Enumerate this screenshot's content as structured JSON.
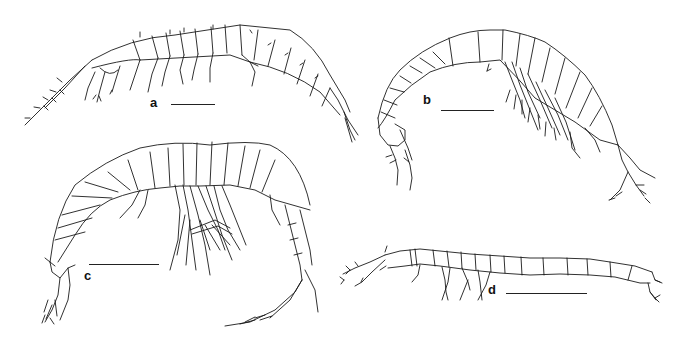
{
  "figure": {
    "panels": [
      {
        "label": "a",
        "label_pos": [
          153,
          102
        ],
        "scale_bar": {
          "x1": 171,
          "x2": 215,
          "y": 104
        }
      },
      {
        "label": "b",
        "label_pos": [
          426,
          99
        ],
        "scale_bar": {
          "x1": 441,
          "x2": 494,
          "y": 110
        }
      },
      {
        "label": "c",
        "label_pos": [
          86,
          275
        ],
        "scale_bar": {
          "x1": 89,
          "x2": 159,
          "y": 264
        }
      },
      {
        "label": "d",
        "label_pos": [
          490,
          289
        ],
        "scale_bar": {
          "x1": 506,
          "x2": 587,
          "y": 293
        }
      }
    ],
    "colors": {
      "ink": "#1a1a1a",
      "background": "#ffffff"
    }
  }
}
